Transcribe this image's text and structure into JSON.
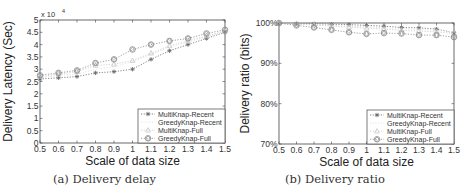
{
  "chart_data": [
    {
      "type": "line",
      "title": "",
      "caption": "(a) Delivery delay",
      "xlabel": "Scale of data size",
      "ylabel": "Delivery Latency (Sec)",
      "y_multiplier_label": "x 10",
      "y_multiplier_exp": "4",
      "x": [
        0.5,
        0.6,
        0.7,
        0.8,
        0.9,
        1.0,
        1.1,
        1.2,
        1.3,
        1.4,
        1.5
      ],
      "xticks": [
        "0.5",
        "0.6",
        "0.7",
        "0.8",
        "0.9",
        "1",
        "1.1",
        "1.2",
        "1.3",
        "1.4",
        "1.5"
      ],
      "yticks": [
        "0",
        "0.5",
        "1",
        "1.5",
        "2",
        "2.5",
        "3",
        "3.5",
        "4",
        "4.5",
        "5"
      ],
      "xlim": [
        0.5,
        1.5
      ],
      "ylim": [
        0,
        5
      ],
      "grid": false,
      "legend_position": "lower right",
      "series": [
        {
          "name": "MultiKnap-Recent",
          "marker": "asterisk",
          "color": "#666666",
          "values": [
            2.6,
            2.65,
            2.7,
            2.85,
            2.9,
            3.0,
            3.4,
            3.75,
            4.0,
            4.25,
            4.5
          ]
        },
        {
          "name": "GreedyKnap-Recent",
          "marker": "none",
          "color": "#dddddd",
          "values": [
            2.65,
            2.75,
            2.8,
            3.0,
            3.1,
            3.3,
            3.6,
            3.9,
            4.1,
            4.3,
            4.55
          ]
        },
        {
          "name": "MultiKnap-Full",
          "marker": "triangle",
          "color": "#c8c8c8",
          "values": [
            2.7,
            2.8,
            2.9,
            3.15,
            3.2,
            3.35,
            3.65,
            3.95,
            4.15,
            4.35,
            4.55
          ]
        },
        {
          "name": "GreedyKnap-Full",
          "marker": "diamond-circle",
          "color": "#888888",
          "values": [
            2.75,
            2.85,
            2.95,
            3.25,
            3.4,
            3.8,
            4.0,
            4.15,
            4.25,
            4.45,
            4.6
          ]
        }
      ]
    },
    {
      "type": "line",
      "title": "",
      "caption": "(b) Delivery ratio",
      "xlabel": "Scale of data size",
      "ylabel": "Delivery ratio (bits)",
      "x": [
        0.5,
        0.6,
        0.7,
        0.8,
        0.9,
        1.0,
        1.1,
        1.2,
        1.3,
        1.4,
        1.5
      ],
      "xticks": [
        "0.5",
        "0.6",
        "0.7",
        "0.8",
        "0.9",
        "1",
        "1.1",
        "1.2",
        "1.3",
        "1.4",
        "1.5"
      ],
      "yticks": [
        "70%",
        "80%",
        "90%",
        "100%"
      ],
      "ytick_values": [
        70,
        80,
        90,
        100
      ],
      "xlim": [
        0.5,
        1.5
      ],
      "ylim": [
        70,
        100
      ],
      "grid": false,
      "legend_position": "lower right",
      "series": [
        {
          "name": "MultiKnap-Recent",
          "marker": "asterisk",
          "color": "#666666",
          "values": [
            99.9,
            99.9,
            99.8,
            99.7,
            99.6,
            99.4,
            99.2,
            98.9,
            98.8,
            98.5,
            97.6
          ]
        },
        {
          "name": "GreedyKnap-Recent",
          "marker": "none",
          "color": "#dddddd",
          "values": [
            99.9,
            99.8,
            99.6,
            99.4,
            99.2,
            99.0,
            98.8,
            98.6,
            98.4,
            98.2,
            97.8
          ]
        },
        {
          "name": "MultiKnap-Full",
          "marker": "triangle",
          "color": "#c8c8c8",
          "values": [
            99.9,
            99.7,
            99.5,
            99.2,
            99.0,
            98.7,
            98.5,
            98.2,
            98.0,
            97.8,
            97.4
          ]
        },
        {
          "name": "GreedyKnap-Full",
          "marker": "diamond-circle",
          "color": "#888888",
          "values": [
            100.0,
            99.4,
            98.9,
            98.3,
            97.7,
            97.3,
            97.5,
            97.4,
            97.0,
            97.0,
            96.5
          ]
        }
      ]
    }
  ]
}
